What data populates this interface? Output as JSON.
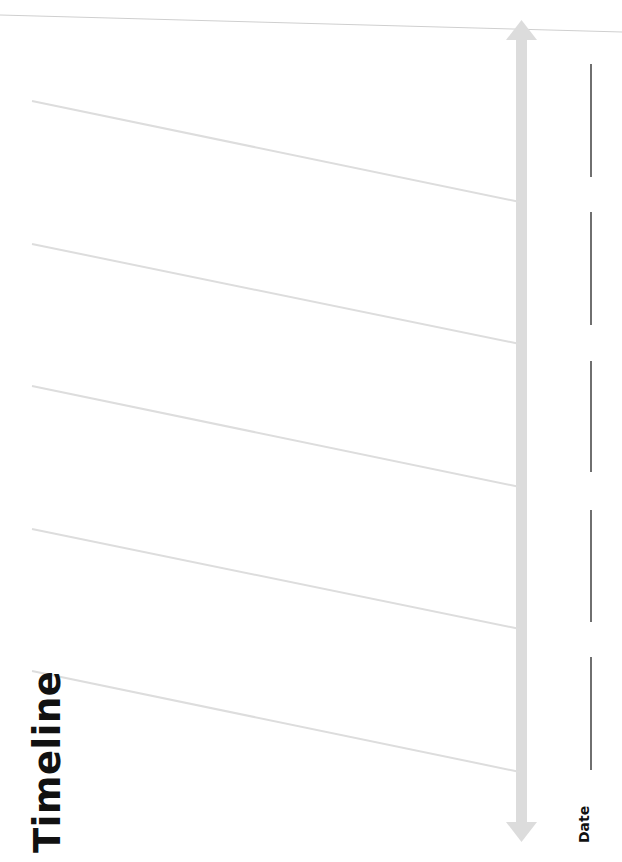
{
  "worksheet": {
    "title": "Timeline",
    "date_label": "Date"
  },
  "colors": {
    "background": "#ffffff",
    "entry_lines": "#dddddd",
    "arrow": "#dcdcdc",
    "date_lines": "#222222",
    "text": "#111111"
  },
  "entries": [
    {
      "line": {
        "x1": 32,
        "y1": 101,
        "x2": 520,
        "y2": 202
      },
      "date_line": {
        "x": 591,
        "y1": 64,
        "y2": 177
      }
    },
    {
      "line": {
        "x1": 32,
        "y1": 244,
        "x2": 520,
        "y2": 344
      },
      "date_line": {
        "x": 591,
        "y1": 212,
        "y2": 325
      }
    },
    {
      "line": {
        "x1": 32,
        "y1": 386,
        "x2": 520,
        "y2": 487
      },
      "date_line": {
        "x": 591,
        "y1": 361,
        "y2": 472
      }
    },
    {
      "line": {
        "x1": 32,
        "y1": 529,
        "x2": 520,
        "y2": 629
      },
      "date_line": {
        "x": 591,
        "y1": 510,
        "y2": 622
      }
    },
    {
      "line": {
        "x1": 32,
        "y1": 671,
        "x2": 520,
        "y2": 772
      },
      "date_line": {
        "x": 591,
        "y1": 657,
        "y2": 770
      }
    }
  ],
  "arrow": {
    "x": 521,
    "y_top": 20,
    "y_bottom": 840
  }
}
